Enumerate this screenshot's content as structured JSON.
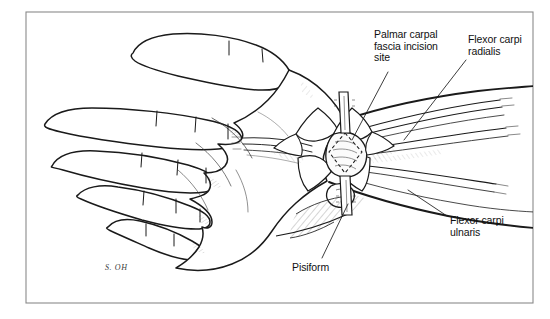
{
  "figure": {
    "panel_letter": "A",
    "signature": "S. OH",
    "frame_color": "#8a8a8a",
    "ink_color": "#1a1a1a",
    "background_color": "#ffffff"
  },
  "labels": {
    "palmar_carpal": "Palmar carpal\nfascia incision\nsite",
    "flexor_carpi_radialis": "Flexor carpi\nradialis",
    "flexor_carpi_ulnaris": "Flexor carpi\nulnaris",
    "pisiform": "Pisiform"
  }
}
